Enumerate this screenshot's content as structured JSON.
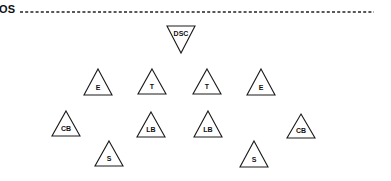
{
  "diagram": {
    "line_label": "OS",
    "line": {
      "x1": 20,
      "x2": 374,
      "y": 12,
      "style": "dashed",
      "color": "#222222"
    },
    "colors": {
      "stroke": "#1a1a1a",
      "fill": "#ffffff",
      "text": "#111111"
    },
    "players": [
      {
        "label": "DSC",
        "position": "deep-safety-center",
        "shape": "triangle-down",
        "cx": 181,
        "top": 26,
        "bottom": 53,
        "half_width": 14
      },
      {
        "label": "E",
        "position": "left-end",
        "shape": "triangle-up",
        "cx": 98,
        "top": 69,
        "bottom": 95,
        "half_width": 14
      },
      {
        "label": "T",
        "position": "left-tackle",
        "shape": "triangle-up",
        "cx": 152,
        "top": 69,
        "bottom": 94,
        "half_width": 14
      },
      {
        "label": "T",
        "position": "right-tackle",
        "shape": "triangle-up",
        "cx": 207,
        "top": 69,
        "bottom": 94,
        "half_width": 14
      },
      {
        "label": "E",
        "position": "right-end",
        "shape": "triangle-up",
        "cx": 261,
        "top": 69,
        "bottom": 95,
        "half_width": 14
      },
      {
        "label": "CB",
        "position": "left-cornerback",
        "shape": "triangle-up",
        "cx": 66,
        "top": 111,
        "bottom": 136,
        "half_width": 14
      },
      {
        "label": "LB",
        "position": "left-linebacker",
        "shape": "triangle-up",
        "cx": 151,
        "top": 112,
        "bottom": 137,
        "half_width": 14
      },
      {
        "label": "LB",
        "position": "right-linebacker",
        "shape": "triangle-up",
        "cx": 208,
        "top": 111,
        "bottom": 137,
        "half_width": 14
      },
      {
        "label": "CB",
        "position": "right-cornerback",
        "shape": "triangle-up",
        "cx": 301,
        "top": 114,
        "bottom": 138,
        "half_width": 14
      },
      {
        "label": "S",
        "position": "left-safety",
        "shape": "triangle-up",
        "cx": 109,
        "top": 141,
        "bottom": 166,
        "half_width": 14
      },
      {
        "label": "S",
        "position": "right-safety",
        "shape": "triangle-up",
        "cx": 254,
        "top": 141,
        "bottom": 167,
        "half_width": 14
      }
    ]
  }
}
